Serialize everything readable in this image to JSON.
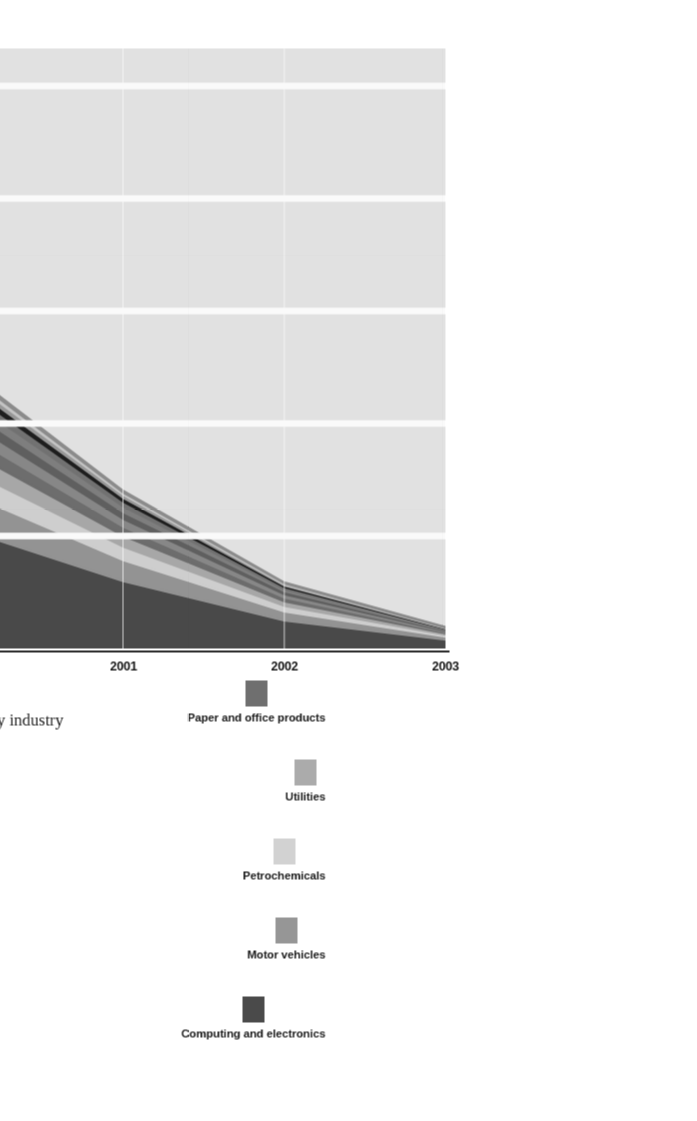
{
  "figure": {
    "caption_label": "Figure 5.2",
    "caption_text": "U.S. B2B Internet commerce revenue by industry"
  },
  "legend": {
    "items": [
      {
        "label": "Industrial equipment",
        "color": "#8e8e8e"
      },
      {
        "label": "Heavy industries",
        "color": "#c9c9c9"
      },
      {
        "label": "Construction",
        "color": "#9b9b9b"
      },
      {
        "label": "Aerospace and defense",
        "color": "#1e1e1e"
      },
      {
        "label": "Phamaceutical and medical",
        "color": "#747474"
      },
      {
        "label": "Consumer goods",
        "color": "#818181"
      },
      {
        "label": "Food and agriculture",
        "color": "#616161"
      },
      {
        "label": "Shipping and warehousing",
        "color": "#8a8a8a"
      },
      {
        "label": "Paper and office products",
        "color": "#6f6f6f"
      },
      {
        "label": "Utilities",
        "color": "#ababab"
      },
      {
        "label": "Petrochemicals",
        "color": "#d2d2d2"
      },
      {
        "label": "Motor vehicles",
        "color": "#969696"
      },
      {
        "label": "Computing and electronics",
        "color": "#4a4a4a"
      }
    ]
  },
  "axes": {
    "y_title": "Revenue in Billions of Dollars",
    "y_ticks": [
      "300",
      "600",
      "900",
      "1,200",
      "1,500"
    ],
    "x_ticks": [
      "1998",
      "1999",
      "2000",
      "2001",
      "2002",
      "2003"
    ]
  },
  "chart_data": {
    "type": "area",
    "title": "U.S. B2B Internet commerce revenue by industry",
    "xlabel": "",
    "ylabel": "Revenue in Billions of Dollars",
    "stacked": true,
    "grid": true,
    "legend_position": "top",
    "x": [
      "1998",
      "1999",
      "2000",
      "2001",
      "2002",
      "2003"
    ],
    "xlim": [
      "1998",
      "2003"
    ],
    "ylim": [
      0,
      1600
    ],
    "yticks": [
      300,
      600,
      900,
      1200,
      1500
    ],
    "series": [
      {
        "name": "Computing and electronics",
        "color": "#4a4a4a",
        "values": [
          24,
          75,
          180,
          320,
          480,
          650
        ]
      },
      {
        "name": "Motor vehicles",
        "color": "#969696",
        "values": [
          8,
          24,
          56,
          100,
          148,
          196
        ]
      },
      {
        "name": "Petrochemicals",
        "color": "#d2d2d2",
        "values": [
          5,
          15,
          36,
          64,
          96,
          128
        ]
      },
      {
        "name": "Utilities",
        "color": "#ababab",
        "values": [
          4,
          12,
          29,
          52,
          78,
          104
        ]
      },
      {
        "name": "Paper and office products",
        "color": "#6f6f6f",
        "values": [
          3,
          10,
          24,
          43,
          64,
          86
        ]
      },
      {
        "name": "Shipping and warehousing",
        "color": "#8a8a8a",
        "values": [
          3,
          9,
          21,
          37,
          55,
          74
        ]
      },
      {
        "name": "Food and agriculture",
        "color": "#616161",
        "values": [
          2,
          8,
          18,
          32,
          48,
          64
        ]
      },
      {
        "name": "Consumer goods",
        "color": "#818181",
        "values": [
          2,
          6,
          15,
          27,
          40,
          53
        ]
      },
      {
        "name": "Phamaceutical and medical",
        "color": "#747474",
        "values": [
          2,
          5,
          13,
          23,
          34,
          45
        ]
      },
      {
        "name": "Aerospace and defense",
        "color": "#1e1e1e",
        "values": [
          1,
          4,
          10,
          18,
          27,
          36
        ]
      },
      {
        "name": "Construction",
        "color": "#9b9b9b",
        "values": [
          1,
          3,
          8,
          14,
          21,
          28
        ]
      },
      {
        "name": "Heavy industries",
        "color": "#c9c9c9",
        "values": [
          1,
          3,
          6,
          11,
          17,
          22
        ]
      },
      {
        "name": "Industrial equipment",
        "color": "#8e8e8e",
        "values": [
          1,
          2,
          5,
          9,
          14,
          18
        ]
      }
    ],
    "totals": [
      57,
      176,
      421,
      750,
      1122,
      1504
    ]
  }
}
